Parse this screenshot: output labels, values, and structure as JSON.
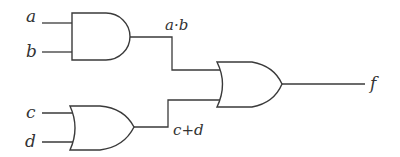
{
  "diagram": {
    "type": "logic-circuit",
    "inputs": [
      {
        "id": "a",
        "label": "a"
      },
      {
        "id": "b",
        "label": "b"
      },
      {
        "id": "c",
        "label": "c"
      },
      {
        "id": "d",
        "label": "d"
      }
    ],
    "gates": [
      {
        "id": "and1",
        "type": "AND",
        "inputs": [
          "a",
          "b"
        ],
        "output_label": "a·b"
      },
      {
        "id": "or1",
        "type": "OR",
        "inputs": [
          "c",
          "d"
        ],
        "output_label": "c+d"
      },
      {
        "id": "or2",
        "type": "OR",
        "inputs": [
          "and1",
          "or1"
        ],
        "output_label": "f"
      }
    ],
    "output": {
      "label": "f"
    }
  },
  "labels": {
    "a": "a",
    "b": "b",
    "c": "c",
    "d": "d",
    "ab": "a·b",
    "cd": "c+d",
    "f": "f"
  }
}
